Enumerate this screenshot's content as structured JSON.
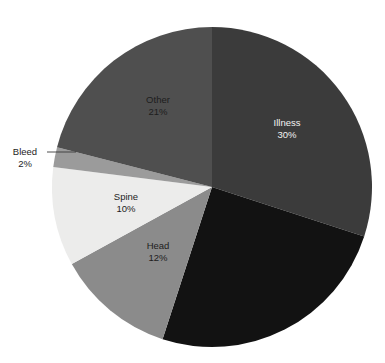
{
  "chart_data": {
    "type": "pie",
    "title": "",
    "subtitle": "",
    "xlabel": "",
    "ylabel": "",
    "legend": "none",
    "grid": false,
    "label_format": "name + percent",
    "start_angle_deg": 0,
    "direction": "clockwise",
    "categories": [
      "Illness",
      "Unlabeled",
      "Head",
      "Spine",
      "Bleed",
      "Other"
    ],
    "values": [
      30,
      25,
      12,
      10,
      2,
      21
    ],
    "colors": [
      "#3b3b3b",
      "#121212",
      "#8b8b8b",
      "#ececeb",
      "#9b9b9b",
      "#4f4f4f"
    ],
    "slices": [
      {
        "name": "Illness",
        "percent": 30,
        "label": "Illness",
        "value_label": "30%",
        "color": "#3b3b3b",
        "label_color": "light",
        "labeled": true,
        "callout": false,
        "start_deg": 0,
        "end_deg": 108,
        "label_x": 287,
        "label_y": 126
      },
      {
        "name": "Unlabeled",
        "percent": 25,
        "label": "",
        "value_label": "",
        "color": "#121212",
        "label_color": "light",
        "labeled": false,
        "callout": false,
        "start_deg": 108,
        "end_deg": 198,
        "label_x": 0,
        "label_y": 0
      },
      {
        "name": "Head",
        "percent": 12,
        "label": "Head",
        "value_label": "12%",
        "color": "#8b8b8b",
        "label_color": "dark",
        "labeled": true,
        "callout": false,
        "start_deg": 198,
        "end_deg": 241.2,
        "label_x": 158,
        "label_y": 249
      },
      {
        "name": "Spine",
        "percent": 10,
        "label": "Spine",
        "value_label": "10%",
        "color": "#ececeb",
        "label_color": "dark",
        "labeled": true,
        "callout": false,
        "start_deg": 241.2,
        "end_deg": 277.2,
        "label_x": 126,
        "label_y": 200
      },
      {
        "name": "Bleed",
        "percent": 2,
        "label": "Bleed",
        "value_label": "2%",
        "color": "#9b9b9b",
        "label_color": "dark",
        "labeled": true,
        "callout": true,
        "start_deg": 277.2,
        "end_deg": 284.4,
        "label_x": 25,
        "label_y": 155,
        "leader_x1": 47,
        "leader_y1": 152,
        "leader_x2": 76,
        "leader_y2": 152
      },
      {
        "name": "Other",
        "percent": 21,
        "label": "Other",
        "value_label": "21%",
        "color": "#4f4f4f",
        "label_color": "dark",
        "labeled": true,
        "callout": false,
        "start_deg": 284.4,
        "end_deg": 360,
        "label_x": 158,
        "label_y": 103
      }
    ],
    "geometry": {
      "center_x": 212,
      "center_y": 187,
      "radius": 160
    },
    "background": "#ffffff"
  }
}
